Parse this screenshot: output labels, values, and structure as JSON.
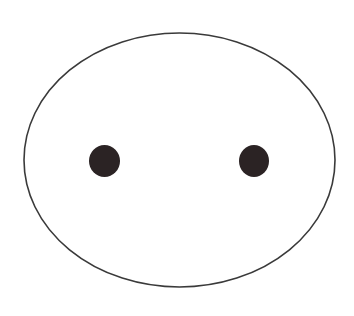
{
  "diagram": {
    "background": "#ffffff",
    "outline": {
      "shape": "ellipse",
      "cx": 179.5,
      "cy": 160,
      "rx": 155.5,
      "ry": 127,
      "stroke": "#3a3a3a",
      "stroke_width": 1.6,
      "fill": "#ffffff"
    },
    "dots": [
      {
        "label": "left-dot",
        "cx": 104.5,
        "cy": 161,
        "rx": 15.5,
        "ry": 16,
        "fill": "#2b2324"
      },
      {
        "label": "right-dot",
        "cx": 254,
        "cy": 161,
        "rx": 15,
        "ry": 16,
        "fill": "#2b2324"
      }
    ]
  }
}
